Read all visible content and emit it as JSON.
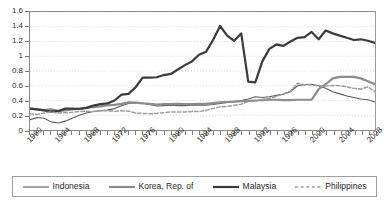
{
  "chart_data": {
    "type": "line",
    "title": "",
    "subtitle": "",
    "xlabel": "",
    "ylabel": "",
    "xlim": [
      1960,
      2009
    ],
    "ylim": [
      0,
      1.6
    ],
    "ytick_values": [
      0,
      0.2,
      0.4,
      0.6,
      0.8,
      1,
      1.2,
      1.4,
      1.6
    ],
    "ytick_labels": [
      "0",
      "0.2",
      "0.4",
      "0.6",
      "0.8",
      "1",
      "1.2",
      "1.4",
      "1.6"
    ],
    "xtick_labels": [
      "1960",
      "1964",
      "1968",
      "1972",
      "1976",
      "1980",
      "1984",
      "1988",
      "1992",
      "1996",
      "2000",
      "2004",
      "2008"
    ],
    "xtick_step": 4,
    "minor_xtick_step": 1,
    "grid": "horizontal-dotted",
    "legend_position": "below",
    "x": [
      1960,
      1961,
      1962,
      1963,
      1964,
      1965,
      1966,
      1967,
      1968,
      1969,
      1970,
      1971,
      1972,
      1973,
      1974,
      1975,
      1976,
      1977,
      1978,
      1979,
      1980,
      1981,
      1982,
      1983,
      1984,
      1985,
      1986,
      1987,
      1988,
      1989,
      1990,
      1991,
      1992,
      1993,
      1994,
      1995,
      1996,
      1997,
      1998,
      1999,
      2000,
      2001,
      2002,
      2003,
      2004,
      2005,
      2006,
      2007,
      2008,
      2009
    ],
    "series": [
      {
        "name": "Indonesia",
        "color": "#5a5a5a",
        "style": "solid",
        "width": 1.1,
        "start_year": 1960,
        "values": [
          0.14,
          0.17,
          0.16,
          0.11,
          0.095,
          0.12,
          0.16,
          0.2,
          0.23,
          0.25,
          0.26,
          0.27,
          0.29,
          0.33,
          0.36,
          0.37,
          0.365,
          0.345,
          0.325,
          0.33,
          0.335,
          0.33,
          0.33,
          0.335,
          0.34,
          0.335,
          0.345,
          0.36,
          0.375,
          0.385,
          0.4,
          0.42,
          0.45,
          0.44,
          0.45,
          0.47,
          0.485,
          0.52,
          0.6,
          0.615,
          0.62,
          0.6,
          0.565,
          0.52,
          0.49,
          0.46,
          0.44,
          0.42,
          0.41,
          0.38
        ]
      },
      {
        "name": "Korea, Rep. of",
        "color": "#8c8c8c",
        "style": "solid",
        "width": 2.2,
        "start_year": 1960,
        "values": [
          0.29,
          0.28,
          0.27,
          0.28,
          0.26,
          0.265,
          0.28,
          0.29,
          0.3,
          0.31,
          0.32,
          0.335,
          0.34,
          0.355,
          0.375,
          0.37,
          0.36,
          0.355,
          0.345,
          0.35,
          0.35,
          0.355,
          0.35,
          0.35,
          0.355,
          0.355,
          0.365,
          0.375,
          0.38,
          0.385,
          0.39,
          0.395,
          0.4,
          0.405,
          0.41,
          0.41,
          0.405,
          0.405,
          0.41,
          0.41,
          0.41,
          0.555,
          0.62,
          0.7,
          0.72,
          0.72,
          0.72,
          0.7,
          0.66,
          0.62
        ]
      },
      {
        "name": "Malaysia",
        "color": "#3b3b3b",
        "style": "solid",
        "width": 2.2,
        "start_year": 1960,
        "values": [
          0.29,
          0.28,
          0.265,
          0.25,
          0.255,
          0.29,
          0.29,
          0.285,
          0.3,
          0.33,
          0.35,
          0.36,
          0.4,
          0.48,
          0.49,
          0.58,
          0.71,
          0.71,
          0.715,
          0.745,
          0.76,
          0.82,
          0.88,
          0.93,
          1.02,
          1.06,
          1.22,
          1.41,
          1.28,
          1.21,
          1.31,
          0.655,
          0.645,
          0.93,
          1.1,
          1.16,
          1.14,
          1.2,
          1.25,
          1.26,
          1.33,
          1.23,
          1.35,
          1.31,
          1.28,
          1.25,
          1.22,
          1.23,
          1.21,
          1.18
        ]
      },
      {
        "name": "Philippines",
        "color": "#9e9e9e",
        "style": "dashed",
        "width": 1.5,
        "start_year": 1960,
        "values": [
          0.22,
          0.21,
          0.23,
          0.245,
          0.23,
          0.235,
          0.24,
          0.25,
          0.255,
          0.25,
          0.26,
          0.26,
          0.255,
          0.26,
          0.255,
          0.23,
          0.225,
          0.22,
          0.225,
          0.235,
          0.245,
          0.245,
          0.245,
          0.25,
          0.25,
          0.265,
          0.29,
          0.315,
          0.32,
          0.335,
          0.35,
          0.385,
          0.39,
          0.415,
          0.43,
          0.455,
          0.49,
          0.53,
          0.635,
          0.615,
          0.61,
          0.595,
          0.595,
          0.605,
          0.6,
          0.585,
          0.565,
          0.555,
          0.585,
          0.52
        ]
      }
    ]
  },
  "legend": {
    "items": [
      {
        "label": "Indonesia",
        "swatch": "line-thin-solid"
      },
      {
        "label": "Korea, Rep. of",
        "swatch": "line-thick-gray"
      },
      {
        "label": "Malaysia",
        "swatch": "line-thick-dark"
      },
      {
        "label": "Philippines",
        "swatch": "line-dashed-gray"
      }
    ]
  }
}
